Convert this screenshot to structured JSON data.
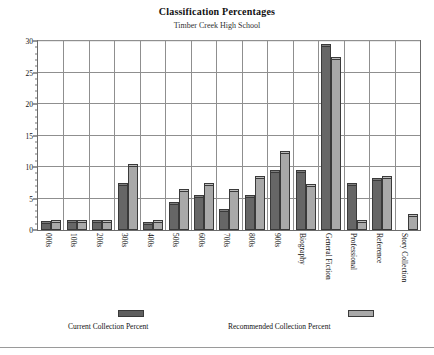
{
  "chart_data": {
    "type": "bar",
    "title": "Classification Percentages",
    "subtitle": "Timber Creek High School",
    "xlabel": "",
    "ylabel": "",
    "ylim": [
      0,
      30
    ],
    "yticks": [
      0,
      5,
      10,
      15,
      20,
      25,
      30
    ],
    "grid": true,
    "legend_position": "bottom",
    "categories": [
      "000s",
      "100s",
      "200s",
      "300s",
      "400s",
      "500s",
      "600s",
      "700s",
      "800s",
      "900s",
      "Biography",
      "General Fiction",
      "Professional",
      "Reference",
      "Story Collection"
    ],
    "series": [
      {
        "name": "Current Collection Percent",
        "color": "#666666",
        "values": [
          1.1,
          1.2,
          1.2,
          7.1,
          1.0,
          4.1,
          5.2,
          3.0,
          5.2,
          9.2,
          9.2,
          29.2,
          7.1,
          8.0,
          0.0
        ]
      },
      {
        "name": "Recommended Collection Percent",
        "color": "#a9a9a9",
        "values": [
          1.2,
          1.2,
          1.2,
          10.2,
          1.3,
          6.2,
          7.1,
          6.2,
          8.2,
          12.2,
          7.0,
          27.2,
          1.3,
          8.2,
          2.2
        ]
      }
    ]
  },
  "legend": {
    "items": [
      {
        "label": "Current Collection Percent",
        "swatch": "dark"
      },
      {
        "label": "Recommended Collection Percent",
        "swatch": "light"
      }
    ]
  },
  "axis": {
    "y_tick_labels": [
      "0",
      "5",
      "10",
      "15",
      "20",
      "25",
      "30"
    ]
  }
}
